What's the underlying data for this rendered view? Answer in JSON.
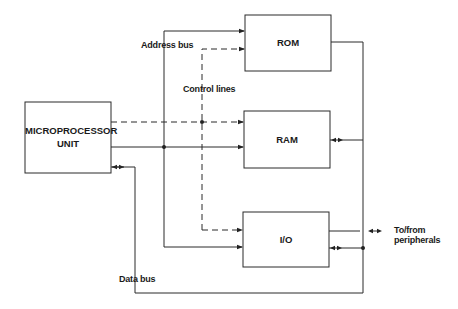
{
  "diagram": {
    "blocks": {
      "mpu": {
        "label_line1": "MICROPROCESSOR",
        "label_line2": "UNIT"
      },
      "rom": {
        "label": "ROM"
      },
      "ram": {
        "label": "RAM"
      },
      "io": {
        "label": "I/O"
      }
    },
    "buses": {
      "address": "Address bus",
      "control": "Control lines",
      "data": "Data bus"
    },
    "external": {
      "line1": "To/from",
      "line2": "peripherals"
    }
  },
  "colors": {
    "line": "#2a2a2a",
    "background": "#ffffff"
  }
}
